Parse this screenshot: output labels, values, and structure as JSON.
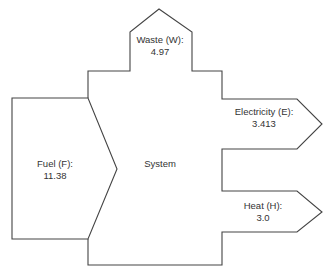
{
  "diagram": {
    "type": "energy-flow (Sankey-style block diagram)",
    "system_label": "System",
    "flows": [
      {
        "id": "fuel",
        "direction": "input",
        "label": "Fuel (F):",
        "value": "11.38"
      },
      {
        "id": "waste",
        "direction": "output",
        "label": "Waste (W):",
        "value": "4.97"
      },
      {
        "id": "electricity",
        "direction": "output",
        "label": "Electricity (E):",
        "value": "3.413"
      },
      {
        "id": "heat",
        "direction": "output",
        "label": "Heat (H):",
        "value": "3.0"
      }
    ],
    "colors": {
      "stroke": "#444444",
      "text": "#333333",
      "background": "#ffffff"
    }
  }
}
